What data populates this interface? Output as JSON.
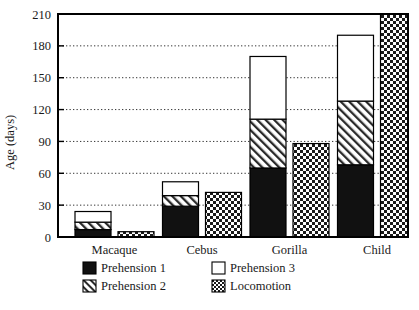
{
  "chart_data": {
    "type": "bar",
    "title": "",
    "xlabel": "",
    "ylabel": "Age (days)",
    "ylim": [
      0,
      210
    ],
    "yticks": [
      0,
      30,
      60,
      90,
      120,
      150,
      180,
      210
    ],
    "ytick_labels": [
      "0",
      "30",
      "60",
      "90",
      "120",
      "150",
      "180",
      "210"
    ],
    "grid": true,
    "grid_axis": "y",
    "legend_position": "below-axes",
    "categories": [
      "Macaque",
      "Cebus",
      "Gorilla",
      "Child"
    ],
    "stacked": true,
    "note": "Each category shows a stacked prehension bar (Prehension 1 + 2 + 3, cumulative tops) next to a separate Locomotion bar.",
    "series": [
      {
        "name": "Prehension 1",
        "pattern": "solid-black",
        "color": "#111111",
        "values": [
          7,
          29,
          65,
          68
        ],
        "cumulative_tops": [
          7,
          29,
          65,
          68
        ]
      },
      {
        "name": "Prehension 2",
        "pattern": "diagonal-hatch",
        "color": "#ffffff",
        "values": [
          7,
          10,
          46,
          60
        ],
        "cumulative_tops": [
          14,
          39,
          111,
          128
        ]
      },
      {
        "name": "Prehension 3",
        "pattern": "white",
        "color": "#ffffff",
        "values": [
          10,
          13,
          59,
          62
        ],
        "cumulative_tops": [
          24,
          52,
          170,
          190
        ]
      },
      {
        "name": "Locomotion",
        "pattern": "checkerboard",
        "color": "#ffffff",
        "values": [
          5,
          42,
          88,
          212
        ],
        "separate_bar": true,
        "clipped_at_top": [
          false,
          false,
          false,
          true
        ]
      }
    ]
  },
  "legend": {
    "entries": [
      {
        "label": "Prehension 1",
        "pattern": "solid-black"
      },
      {
        "label": "Prehension 3",
        "pattern": "white"
      },
      {
        "label": "Prehension 2",
        "pattern": "diagonal-hatch"
      },
      {
        "label": "Locomotion",
        "pattern": "checkerboard"
      }
    ]
  }
}
